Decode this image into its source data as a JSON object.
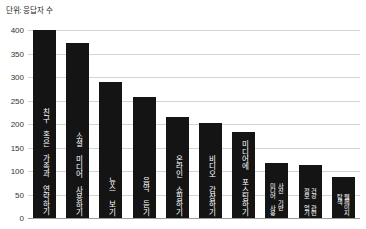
{
  "caption": {
    "unit_label": "단위: 응답자 수"
  },
  "chart_data": {
    "type": "bar",
    "title": "",
    "subtitle": "",
    "xlabel": "",
    "ylabel": "단위: 응답자 수",
    "ylim": [
      0,
      400
    ],
    "ytick_values": [
      400,
      350,
      300,
      250,
      200,
      150,
      100,
      50,
      0
    ],
    "ytick_labels": [
      "400",
      "350",
      "300",
      "250",
      "200",
      "150",
      "100",
      "50",
      "0"
    ],
    "grid": true,
    "legend": false,
    "bar_color": "#141414",
    "categories": [
      "친구 혹은 가족과 연락하기",
      "소셜 미디어 사용하기",
      "뉴스 보기",
      "음악 듣기",
      "온라인 쇼핑하기",
      "비디오 감상하기",
      "소셜 미디어에 포스팅하기",
      "사진 기반\n미디어 사용",
      "건강 관련\n정보 얻기",
      "웹페이지\n탐색"
    ],
    "values": [
      400,
      372,
      290,
      258,
      215,
      203,
      182,
      118,
      112,
      88
    ]
  }
}
